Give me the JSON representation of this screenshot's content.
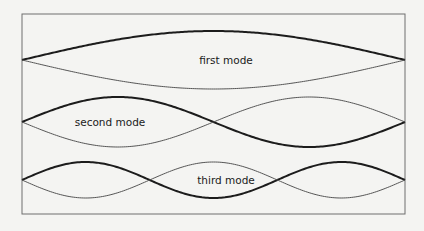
{
  "diagram": {
    "modes": [
      {
        "name": "first mode",
        "harmonic": 1
      },
      {
        "name": "second mode",
        "harmonic": 2
      },
      {
        "name": "third mode",
        "harmonic": 3
      }
    ]
  }
}
